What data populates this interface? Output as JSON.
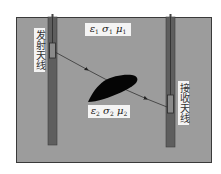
{
  "diagram": {
    "type": "cross-hole radar schematic",
    "colors": {
      "ground": "#9c9c9c",
      "ground_border": "#3a3a3a",
      "borehole": "#5e5e5e",
      "borehole_edge": "#3c3c3c",
      "anomaly": "#050505",
      "ray": "#333333",
      "label_bg": "#f4f4f4"
    },
    "transmitter": {
      "label": "发射天线"
    },
    "receiver": {
      "label": "接收天线"
    },
    "medium_1": {
      "eps": "ε",
      "eps_sub": "1",
      "sigma": "σ",
      "sigma_sub": "1",
      "mu": "μ",
      "mu_sub": "1"
    },
    "medium_2": {
      "eps": "ε",
      "eps_sub": "2",
      "sigma": "σ",
      "sigma_sub": "2",
      "mu": "μ",
      "mu_sub": "2"
    }
  }
}
